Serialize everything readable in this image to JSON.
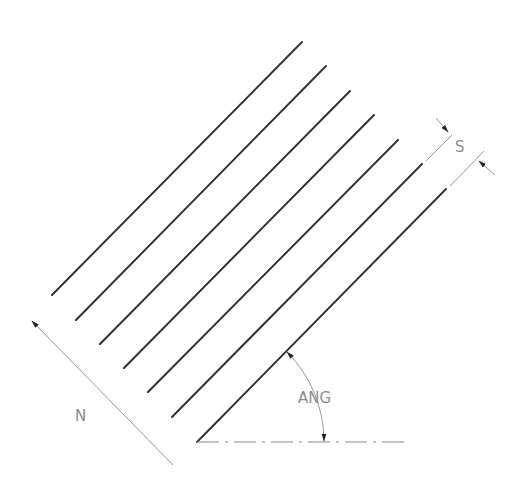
{
  "diagram": {
    "type": "hatch-pattern-parameters",
    "labels": {
      "spacing": "S",
      "angle": "ANG",
      "count": "N"
    },
    "hatch_lines": [
      {
        "x1": 52,
        "y1": 295,
        "x2": 302,
        "y2": 42
      },
      {
        "x1": 76,
        "y1": 320,
        "x2": 326,
        "y2": 66
      },
      {
        "x1": 100,
        "y1": 344,
        "x2": 350,
        "y2": 91
      },
      {
        "x1": 124,
        "y1": 368,
        "x2": 374,
        "y2": 115
      },
      {
        "x1": 148,
        "y1": 392,
        "x2": 398,
        "y2": 140
      },
      {
        "x1": 172,
        "y1": 417,
        "x2": 422,
        "y2": 164
      },
      {
        "x1": 197,
        "y1": 442,
        "x2": 446,
        "y2": 189
      }
    ],
    "colors": {
      "line": "#333333",
      "dimension": "#9a9a9a",
      "text": "#8c8c8c"
    }
  }
}
